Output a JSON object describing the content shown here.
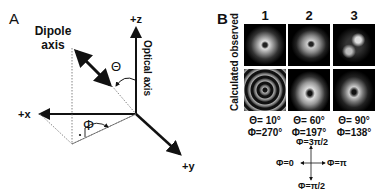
{
  "panel_a": {
    "label": "A",
    "dipole_label_line1": "Dipole",
    "dipole_label_line2": "axis",
    "optical_axis_label": "Optical axis",
    "theta_symbol": "Θ",
    "phi_symbol": "Φ",
    "axes": {
      "z": "+z",
      "x": "+x",
      "y": "+y"
    }
  },
  "panel_b": {
    "label": "B",
    "row_labels": {
      "top": "observed",
      "bottom": "Calculated",
      "full": "Calculated observed"
    },
    "columns": [
      {
        "number": "1",
        "theta": "Θ=  10°",
        "phi": "Φ=270°"
      },
      {
        "number": "2",
        "theta": "Θ=  60°",
        "phi": "Φ=197°"
      },
      {
        "number": "3",
        "theta": "Θ=  90°",
        "phi": "Φ=138°"
      }
    ],
    "compass": {
      "top": "Φ=3π/2",
      "left": "Φ=0",
      "right": "Φ=π",
      "bottom": "Φ=π/2"
    }
  }
}
